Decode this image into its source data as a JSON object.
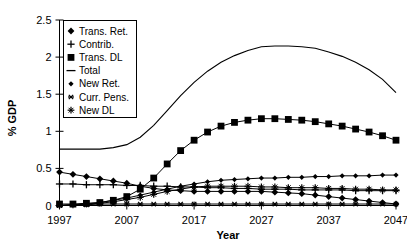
{
  "chart_data": {
    "type": "line",
    "title": "",
    "xlabel": "Year",
    "ylabel": "% GDP",
    "xlim": [
      1997,
      2047
    ],
    "ylim": [
      0,
      2.5
    ],
    "xticks": [
      1997,
      2007,
      2017,
      2027,
      2037,
      2047
    ],
    "xtick_labels": [
      "1997",
      "2007",
      "2017",
      "2027",
      "2037",
      "2047"
    ],
    "yticks": [
      0,
      0.5,
      1,
      1.5,
      2,
      2.5
    ],
    "ytick_labels": [
      "0",
      "0.5",
      "1",
      "1.5",
      "2",
      "2.5"
    ],
    "grid": false,
    "legend_position": "upper-left-inside",
    "x": [
      1997,
      1999,
      2001,
      2003,
      2005,
      2007,
      2009,
      2011,
      2013,
      2015,
      2017,
      2019,
      2021,
      2023,
      2025,
      2027,
      2029,
      2031,
      2033,
      2035,
      2037,
      2039,
      2041,
      2043,
      2045,
      2047
    ],
    "series": [
      {
        "name": "Trans. Ret.",
        "marker": "diamond",
        "values": [
          0.45,
          0.42,
          0.39,
          0.36,
          0.33,
          0.3,
          0.26,
          0.23,
          0.21,
          0.2,
          0.19,
          0.19,
          0.19,
          0.19,
          0.19,
          0.19,
          0.18,
          0.17,
          0.16,
          0.14,
          0.12,
          0.1,
          0.08,
          0.06,
          0.04,
          0.02
        ]
      },
      {
        "name": "Contrib.",
        "marker": "plus",
        "values": [
          0.29,
          0.29,
          0.28,
          0.28,
          0.28,
          0.27,
          0.27,
          0.26,
          0.26,
          0.25,
          0.25,
          0.24,
          0.24,
          0.23,
          0.23,
          0.22,
          0.22,
          0.22,
          0.21,
          0.21,
          0.21,
          0.21,
          0.2,
          0.2,
          0.2,
          0.2
        ]
      },
      {
        "name": "Trans. DL",
        "marker": "square",
        "values": [
          0.02,
          0.02,
          0.03,
          0.04,
          0.07,
          0.12,
          0.22,
          0.37,
          0.56,
          0.74,
          0.88,
          0.99,
          1.07,
          1.12,
          1.15,
          1.17,
          1.17,
          1.16,
          1.15,
          1.13,
          1.1,
          1.07,
          1.03,
          0.99,
          0.94,
          0.88
        ]
      },
      {
        "name": "Total",
        "marker": "none",
        "values": [
          0.76,
          0.76,
          0.76,
          0.76,
          0.78,
          0.82,
          0.92,
          1.08,
          1.28,
          1.48,
          1.66,
          1.81,
          1.93,
          2.02,
          2.09,
          2.14,
          2.15,
          2.15,
          2.14,
          2.12,
          2.07,
          2.01,
          1.93,
          1.83,
          1.7,
          1.52
        ]
      },
      {
        "name": "New Ret.",
        "marker": "diamond-small",
        "values": [
          0.0,
          0.01,
          0.02,
          0.04,
          0.07,
          0.1,
          0.14,
          0.18,
          0.22,
          0.26,
          0.29,
          0.32,
          0.34,
          0.35,
          0.36,
          0.37,
          0.37,
          0.38,
          0.38,
          0.39,
          0.39,
          0.4,
          0.4,
          0.4,
          0.41,
          0.41
        ]
      },
      {
        "name": "Curr. Pens.",
        "marker": "star",
        "values": [
          0.0,
          0.01,
          0.01,
          0.02,
          0.02,
          0.02,
          0.02,
          0.02,
          0.02,
          0.02,
          0.02,
          0.02,
          0.02,
          0.02,
          0.02,
          0.02,
          0.02,
          0.02,
          0.02,
          0.02,
          0.02,
          0.02,
          0.02,
          0.02,
          0.02,
          0.02
        ]
      },
      {
        "name": "New  DL",
        "marker": "plus-star",
        "values": [
          0.0,
          0.01,
          0.02,
          0.03,
          0.05,
          0.08,
          0.11,
          0.15,
          0.19,
          0.22,
          0.25,
          0.26,
          0.26,
          0.26,
          0.26,
          0.25,
          0.25,
          0.24,
          0.24,
          0.24,
          0.23,
          0.23,
          0.22,
          0.22,
          0.21,
          0.21
        ]
      }
    ],
    "legend_entries": [
      {
        "label": "Trans. Ret.",
        "marker": "diamond"
      },
      {
        "label": "Contrib.",
        "marker": "plus"
      },
      {
        "label": "Trans. DL",
        "marker": "square"
      },
      {
        "label": "Total",
        "marker": "line"
      },
      {
        "label": "New Ret.",
        "marker": "diamond-small"
      },
      {
        "label": "Curr. Pens.",
        "marker": "star"
      },
      {
        "label": "New  DL",
        "marker": "plus-star"
      }
    ]
  },
  "colors": {
    "ink": "#000000",
    "background": "#ffffff"
  }
}
